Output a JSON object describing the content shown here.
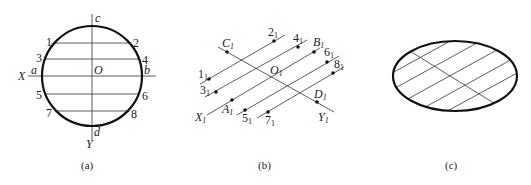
{
  "figures": [
    {
      "id": "a",
      "caption": "(a)",
      "shape": "circle",
      "center_label": "O",
      "axis_labels": {
        "x": "X",
        "y": "Y"
      },
      "diameter_endpoints": {
        "left": "a",
        "right": "b",
        "top": "c",
        "bottom": "d"
      },
      "chord_labels": [
        {
          "left": "1",
          "right": "2"
        },
        {
          "left": "3",
          "right": "4"
        },
        {
          "left": "5",
          "right": "6"
        },
        {
          "left": "7",
          "right": "8"
        }
      ]
    },
    {
      "id": "b",
      "caption": "(b)",
      "shape": "conjugate-diameter construction",
      "center_label": "O",
      "axis_labels": {
        "x": "X",
        "y": "Y"
      },
      "diameter_endpoints": {
        "left": "A",
        "right": "B",
        "top": "C",
        "bottom": "D"
      },
      "subscript": "1",
      "chord_labels": [
        {
          "left": "1",
          "right": "2"
        },
        {
          "left": "3",
          "right": "4"
        },
        {
          "left": "5",
          "right": "6"
        },
        {
          "left": "7",
          "right": "8"
        }
      ]
    },
    {
      "id": "c",
      "caption": "(c)",
      "shape": "ellipse with parallel chords"
    }
  ]
}
